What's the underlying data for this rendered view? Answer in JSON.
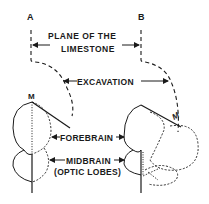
{
  "diagram": {
    "type": "anatomical-schematic",
    "colors": {
      "ink": "#1a1a1a",
      "background": "#ffffff"
    },
    "labels": {
      "point_a": "A",
      "point_b": "B",
      "plane_line1": "PLANE OF THE",
      "plane_line2": "LIMESTONE",
      "excavation": "EXCAVATION",
      "m_left": "M",
      "m_right": "M",
      "forebrain": "FOREBRAIN",
      "midbrain": "MIDBRAIN",
      "optic_lobes": "(OPTIC LOBES)"
    },
    "figures": [
      {
        "id": "left",
        "description": "brain outline in original position"
      },
      {
        "id": "right",
        "description": "brain outline rotated along excavation"
      }
    ]
  }
}
